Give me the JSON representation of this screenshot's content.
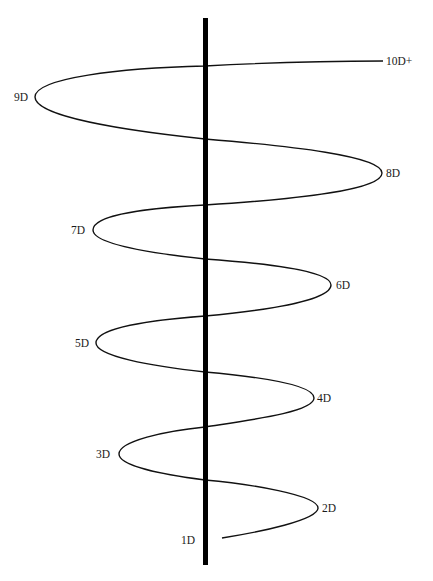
{
  "diagram": {
    "type": "helical spiral around vertical axis",
    "colors": {
      "background": "#ffffff",
      "axis": "#000000",
      "spiral": "#111111",
      "label": "#1a1a1a"
    },
    "axis": {
      "x": 205,
      "y_top": 18,
      "y_bottom": 565,
      "width": 5
    },
    "labels": [
      {
        "id": "1D",
        "text": "1D",
        "x": 181,
        "y": 544
      },
      {
        "id": "2D",
        "text": "2D",
        "x": 322,
        "y": 512
      },
      {
        "id": "3D",
        "text": "3D",
        "x": 96,
        "y": 458
      },
      {
        "id": "4D",
        "text": "4D",
        "x": 317,
        "y": 402
      },
      {
        "id": "5D",
        "text": "5D",
        "x": 75,
        "y": 347
      },
      {
        "id": "6D",
        "text": "6D",
        "x": 336,
        "y": 289
      },
      {
        "id": "7D",
        "text": "7D",
        "x": 71,
        "y": 234
      },
      {
        "id": "8D",
        "text": "8D",
        "x": 386,
        "y": 177
      },
      {
        "id": "9D",
        "text": "9D",
        "x": 14,
        "y": 101
      },
      {
        "id": "10D+",
        "text": "10D+",
        "x": 386,
        "y": 65
      }
    ]
  }
}
